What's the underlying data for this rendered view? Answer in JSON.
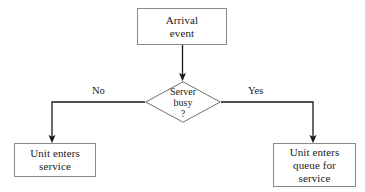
{
  "diagram": {
    "type": "flowchart",
    "background_color": "#ffffff",
    "line_color": "#1a1a1a",
    "box_border_color": "#8a8a8a",
    "text_color": "#1a1a1a",
    "nodes": {
      "arrival": {
        "shape": "rectangle",
        "label": "Arrival\nevent"
      },
      "decision": {
        "shape": "diamond",
        "line1": "Server",
        "line2": "busy",
        "line3": "?"
      },
      "enters_service": {
        "shape": "rectangle",
        "label": "Unit enters\nservice"
      },
      "enters_queue": {
        "shape": "rectangle",
        "label": "Unit enters\nqueue for\nservice"
      }
    },
    "branches": {
      "no_label": "No",
      "yes_label": "Yes"
    }
  }
}
